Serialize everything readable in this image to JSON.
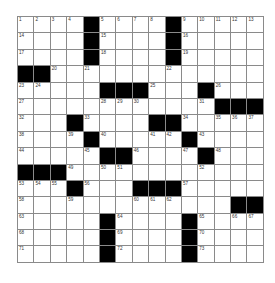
{
  "puzzle": {
    "rows": 15,
    "cols": 15,
    "colors": {
      "block": "#000000",
      "cell": "#ffffff",
      "line": "#8a8a8a"
    },
    "blocks": [
      [
        1,
        5
      ],
      [
        1,
        10
      ],
      [
        2,
        5
      ],
      [
        2,
        10
      ],
      [
        3,
        5
      ],
      [
        3,
        10
      ],
      [
        4,
        1
      ],
      [
        4,
        2
      ],
      [
        5,
        6
      ],
      [
        5,
        7
      ],
      [
        5,
        8
      ],
      [
        5,
        12
      ],
      [
        6,
        13
      ],
      [
        6,
        14
      ],
      [
        6,
        15
      ],
      [
        7,
        4
      ],
      [
        7,
        9
      ],
      [
        7,
        10
      ],
      [
        8,
        5
      ],
      [
        8,
        11
      ],
      [
        9,
        6
      ],
      [
        9,
        7
      ],
      [
        9,
        12
      ],
      [
        10,
        1
      ],
      [
        10,
        2
      ],
      [
        10,
        3
      ],
      [
        11,
        4
      ],
      [
        11,
        8
      ],
      [
        11,
        9
      ],
      [
        11,
        10
      ],
      [
        12,
        14
      ],
      [
        12,
        15
      ],
      [
        13,
        6
      ],
      [
        13,
        11
      ],
      [
        14,
        6
      ],
      [
        14,
        11
      ],
      [
        15,
        6
      ],
      [
        15,
        11
      ]
    ],
    "numbers": [
      [
        1,
        1,
        "1"
      ],
      [
        1,
        2,
        "2"
      ],
      [
        1,
        3,
        "3"
      ],
      [
        1,
        4,
        "4"
      ],
      [
        1,
        6,
        "5"
      ],
      [
        1,
        7,
        "6"
      ],
      [
        1,
        8,
        "7"
      ],
      [
        1,
        9,
        "8"
      ],
      [
        1,
        11,
        "9"
      ],
      [
        1,
        12,
        "10"
      ],
      [
        1,
        13,
        "11"
      ],
      [
        1,
        14,
        "12"
      ],
      [
        1,
        15,
        "13"
      ],
      [
        2,
        1,
        "14"
      ],
      [
        2,
        6,
        "15"
      ],
      [
        2,
        11,
        "16"
      ],
      [
        3,
        1,
        "17"
      ],
      [
        3,
        6,
        "18"
      ],
      [
        3,
        11,
        "19"
      ],
      [
        4,
        3,
        "20"
      ],
      [
        4,
        5,
        "21"
      ],
      [
        4,
        10,
        "22"
      ],
      [
        5,
        1,
        "23"
      ],
      [
        5,
        2,
        "24"
      ],
      [
        5,
        9,
        "25"
      ],
      [
        5,
        13,
        "26"
      ],
      [
        6,
        1,
        "27"
      ],
      [
        6,
        6,
        "28"
      ],
      [
        6,
        7,
        "29"
      ],
      [
        6,
        8,
        "30"
      ],
      [
        6,
        12,
        "31"
      ],
      [
        7,
        1,
        "32"
      ],
      [
        7,
        5,
        "33"
      ],
      [
        7,
        11,
        "34"
      ],
      [
        7,
        13,
        "35"
      ],
      [
        7,
        14,
        "36"
      ],
      [
        7,
        15,
        "37"
      ],
      [
        8,
        1,
        "38"
      ],
      [
        8,
        4,
        "39"
      ],
      [
        8,
        6,
        "40"
      ],
      [
        8,
        9,
        "41"
      ],
      [
        8,
        10,
        "42"
      ],
      [
        8,
        12,
        "43"
      ],
      [
        9,
        1,
        "44"
      ],
      [
        9,
        5,
        "45"
      ],
      [
        9,
        8,
        "46"
      ],
      [
        9,
        11,
        "47"
      ],
      [
        9,
        13,
        "48"
      ],
      [
        10,
        4,
        "49"
      ],
      [
        10,
        6,
        "50"
      ],
      [
        10,
        7,
        "51"
      ],
      [
        10,
        12,
        "52"
      ],
      [
        11,
        1,
        "53"
      ],
      [
        11,
        2,
        "54"
      ],
      [
        11,
        3,
        "55"
      ],
      [
        11,
        5,
        "56"
      ],
      [
        11,
        11,
        "57"
      ],
      [
        12,
        1,
        "58"
      ],
      [
        12,
        4,
        "59"
      ],
      [
        12,
        8,
        "60"
      ],
      [
        12,
        9,
        "61"
      ],
      [
        12,
        10,
        "62"
      ],
      [
        13,
        1,
        "63"
      ],
      [
        13,
        7,
        "64"
      ],
      [
        13,
        12,
        "65"
      ],
      [
        13,
        14,
        "66"
      ],
      [
        13,
        15,
        "67"
      ],
      [
        14,
        1,
        "68"
      ],
      [
        14,
        7,
        "69"
      ],
      [
        14,
        12,
        "70"
      ],
      [
        15,
        1,
        "71"
      ],
      [
        15,
        7,
        "72"
      ],
      [
        15,
        12,
        "73"
      ]
    ]
  }
}
